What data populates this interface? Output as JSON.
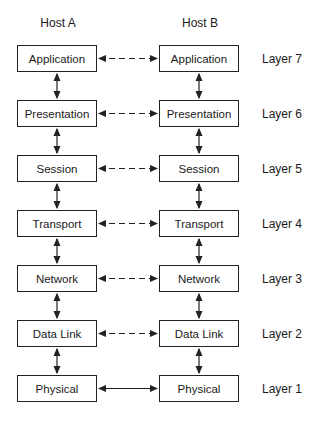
{
  "hosts": [
    {
      "title": "Host A"
    },
    {
      "title": "Host B"
    }
  ],
  "layers": [
    {
      "name": "Application",
      "label": "Layer 7",
      "peer_link": "dashed"
    },
    {
      "name": "Presentation",
      "label": "Layer 6",
      "peer_link": "dashed"
    },
    {
      "name": "Session",
      "label": "Layer 5",
      "peer_link": "dashed"
    },
    {
      "name": "Transport",
      "label": "Layer 4",
      "peer_link": "dashed"
    },
    {
      "name": "Network",
      "label": "Layer 3",
      "peer_link": "dashed"
    },
    {
      "name": "Data Link",
      "label": "Layer 2",
      "peer_link": "dashed"
    },
    {
      "name": "Physical",
      "label": "Layer 1",
      "peer_link": "solid"
    }
  ],
  "colors": {
    "line": "#222222",
    "background": "#ffffff"
  }
}
